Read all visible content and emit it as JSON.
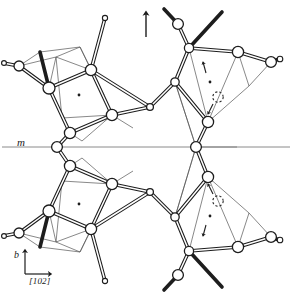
{
  "figure": {
    "type": "crystal-structure-projection",
    "width": 295,
    "height": 299,
    "background_color": "#ffffff",
    "line_color": "#1d1d1d",
    "mirror_line_color": "#7a7a7a",
    "thin_line_color": "#4a4a4a",
    "atom_fill_color": "#ffffff",
    "atom_stroke_color": "#1d1d1d"
  },
  "labels": {
    "mirror_plane": "m",
    "axis_vertical": "b",
    "axis_horizontal": "[102]"
  },
  "annotations": {
    "top_arrow": {
      "name": "up-arrow",
      "x": 146,
      "y_tail": 37,
      "y_head": 11
    },
    "axis_indicator": {
      "origin_x": 25,
      "origin_y": 274,
      "vertical_tip_y": 249,
      "horizontal_tip_x": 53
    },
    "mirror_line": {
      "x1": 2,
      "x2": 290,
      "y": 147
    }
  },
  "atoms": {
    "large_radius": 5.6,
    "medium_radius": 4.2,
    "small_radius": 2.4,
    "dot_radius": 1.3,
    "dashed_circle_radius": 5.2,
    "large": [
      {
        "name": "atom-ul-a",
        "x": 19,
        "y": 66
      },
      {
        "name": "atom-ul-b",
        "x": 49,
        "y": 88
      },
      {
        "name": "atom-ul-c",
        "x": 91,
        "y": 70
      },
      {
        "name": "atom-ul-d",
        "x": 112,
        "y": 115
      },
      {
        "name": "atom-ul-e",
        "x": 70,
        "y": 133
      },
      {
        "name": "atom-ul-f",
        "x": 150,
        "y": 107
      },
      {
        "name": "atom-ll-a",
        "x": 19,
        "y": 233
      },
      {
        "name": "atom-ll-b",
        "x": 49,
        "y": 211
      },
      {
        "name": "atom-ll-c",
        "x": 91,
        "y": 229
      },
      {
        "name": "atom-ll-d",
        "x": 112,
        "y": 184
      },
      {
        "name": "atom-ll-e",
        "x": 70,
        "y": 166
      },
      {
        "name": "atom-ll-f",
        "x": 150,
        "y": 192
      },
      {
        "name": "atom-ur-a",
        "x": 178,
        "y": 24
      },
      {
        "name": "atom-ur-b",
        "x": 189,
        "y": 48
      },
      {
        "name": "atom-ur-c",
        "x": 238,
        "y": 52
      },
      {
        "name": "atom-ur-d",
        "x": 271,
        "y": 62
      },
      {
        "name": "atom-ur-e",
        "x": 208,
        "y": 122
      },
      {
        "name": "atom-ur-f",
        "x": 175,
        "y": 82
      },
      {
        "name": "atom-lr-a",
        "x": 178,
        "y": 275
      },
      {
        "name": "atom-lr-b",
        "x": 189,
        "y": 251
      },
      {
        "name": "atom-lr-c",
        "x": 238,
        "y": 247
      },
      {
        "name": "atom-lr-d",
        "x": 271,
        "y": 237
      },
      {
        "name": "atom-lr-e",
        "x": 208,
        "y": 177
      },
      {
        "name": "atom-lr-f",
        "x": 175,
        "y": 217
      },
      {
        "name": "atom-mirror-left",
        "x": 57,
        "y": 147
      },
      {
        "name": "atom-mirror-right",
        "x": 196,
        "y": 147
      }
    ],
    "small": [
      {
        "name": "atom-small-top-stub",
        "x": 105,
        "y": 18
      },
      {
        "name": "atom-small-bottom-stub",
        "x": 105,
        "y": 281
      },
      {
        "name": "atom-small-left-upper",
        "x": 3,
        "y": 63
      },
      {
        "name": "atom-small-left-lower",
        "x": 3,
        "y": 236
      },
      {
        "name": "atom-small-ur-tip",
        "x": 279,
        "y": 59
      },
      {
        "name": "atom-small-lr-tip",
        "x": 279,
        "y": 240
      }
    ],
    "center_dots": [
      {
        "name": "site-dot-upper-left",
        "x": 79,
        "y": 95
      },
      {
        "name": "site-dot-lower-left",
        "x": 79,
        "y": 204
      },
      {
        "name": "site-dot-upper-right",
        "x": 210,
        "y": 82
      },
      {
        "name": "site-dot-lower-right",
        "x": 210,
        "y": 216
      }
    ],
    "dashed_circles": [
      {
        "name": "partial-site-upper-right",
        "x": 218,
        "y": 97
      },
      {
        "name": "partial-site-lower-right",
        "x": 218,
        "y": 201
      }
    ],
    "displacement_arrows": [
      {
        "name": "displacement-arrow-ur-upper",
        "x1": 206,
        "y1": 72,
        "x2": 203,
        "y2": 61
      },
      {
        "name": "displacement-arrow-ur-lower",
        "x1": 212,
        "y1": 103,
        "x2": 207,
        "y2": 113
      },
      {
        "name": "displacement-arrow-lr-upper",
        "x1": 212,
        "y1": 195,
        "x2": 207,
        "y2": 185
      },
      {
        "name": "displacement-arrow-lr-lower",
        "x1": 206,
        "y1": 226,
        "x2": 203,
        "y2": 237
      }
    ]
  }
}
